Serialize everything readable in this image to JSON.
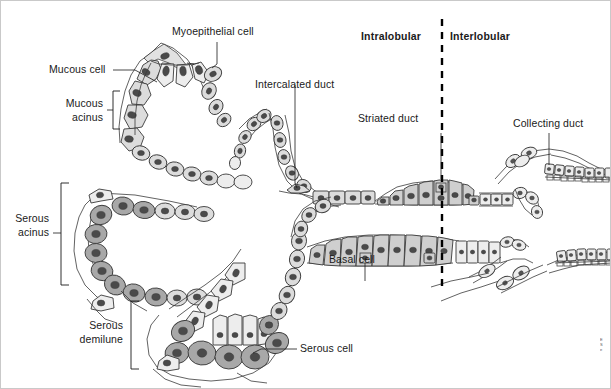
{
  "figure": {
    "background_color": "#ffffff",
    "border_color": "#c9c9c9"
  },
  "labels": {
    "myoepithelial_cell": "Myoepithelial cell",
    "mucous_cell": "Mucous cell",
    "mucous_acinus_line1": "Mucous",
    "mucous_acinus_line2": "acinus",
    "serous_acinus_line1": "Serous",
    "serous_acinus_line2": "acinus",
    "serous_demilune_line1": "Serous",
    "serous_demilune_line2": "demilune",
    "serous_cell": "Serous cell",
    "intercalated_duct": "Intercalated duct",
    "striated_duct": "Striated duct",
    "basal_cell": "Basal cell",
    "collecting_duct": "Collecting duct",
    "intralobular": "Intralobular",
    "interlobular": "Interlobular"
  },
  "colors": {
    "mucous_cell_fill": "#dcdcdc",
    "serous_cell_fill": "#a8a8a8",
    "duct_cell_fill": "#cfcfcf",
    "pale_cell_fill": "#ededed",
    "nucleus_fill": "#4a4a4a",
    "outline": "#3a3a3a",
    "label_text": "#1a1a1a",
    "divider": "#000000"
  },
  "divider": {
    "style": "dashed",
    "orientation": "vertical",
    "left_region": "Intralobular",
    "right_region": "Interlobular"
  },
  "structures": [
    {
      "name": "mucous-acinus",
      "cell_type": "mucous",
      "fill": "#dcdcdc"
    },
    {
      "name": "serous-acinus",
      "cell_type": "serous",
      "fill": "#a8a8a8"
    },
    {
      "name": "serous-demilune",
      "cell_type": "serous",
      "fill": "#a8a8a8"
    },
    {
      "name": "intercalated-duct",
      "cell_type": "simple cuboidal",
      "fill": "#cfcfcf"
    },
    {
      "name": "striated-duct",
      "cell_type": "simple columnar",
      "fill": "#cfcfcf"
    },
    {
      "name": "collecting-duct",
      "cell_type": "stratified",
      "fill": "#ededed"
    },
    {
      "name": "basal-cell",
      "cell_type": "basal",
      "fill": "#cfcfcf"
    },
    {
      "name": "myoepithelial-cell",
      "cell_type": "myoepithelial",
      "fill": "#e4e4e4"
    }
  ],
  "corner_mark": {
    "line1": "E",
    "line2": "S",
    "line3": "e"
  }
}
